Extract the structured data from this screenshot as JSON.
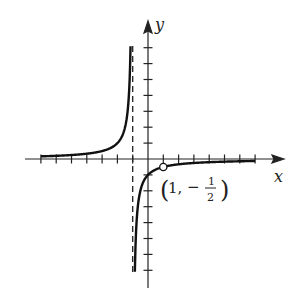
{
  "chart_data": {
    "type": "line",
    "title": "",
    "function": "y = -1/(x+1), x ≠ 1",
    "xlabel": "x",
    "ylabel": "y",
    "xlim": [
      -7,
      7
    ],
    "ylim": [
      -7,
      7
    ],
    "x_ticks": [
      -7,
      -6,
      -5,
      -4,
      -3,
      -2,
      -1,
      1,
      2,
      3,
      4,
      5,
      6,
      7
    ],
    "y_ticks": [
      -7,
      -6,
      -5,
      -4,
      -3,
      -2,
      -1,
      1,
      2,
      3,
      4,
      5,
      6,
      7
    ],
    "grid": false,
    "vertical_asymptote": -1,
    "horizontal_asymptote": 0,
    "hole": {
      "x": 1,
      "y": -0.5,
      "label": "(1, -1/2)"
    },
    "series": [
      {
        "name": "left-branch",
        "x": [
          -7,
          -5,
          -3,
          -2,
          -1.5,
          -1.2,
          -1.14
        ],
        "y": [
          0.167,
          0.25,
          0.5,
          1,
          2,
          5,
          7
        ]
      },
      {
        "name": "right-branch",
        "x": [
          -0.86,
          -0.8,
          -0.5,
          0,
          1,
          3,
          7
        ],
        "y": [
          -7,
          -5,
          -2,
          -1,
          -0.5,
          -0.25,
          -0.125
        ]
      }
    ]
  },
  "labels": {
    "x_axis": "x",
    "y_axis": "y",
    "point_open": "(",
    "point_x": "1,",
    "point_minus": "−",
    "point_num": "1",
    "point_den": "2",
    "point_close": ")"
  }
}
